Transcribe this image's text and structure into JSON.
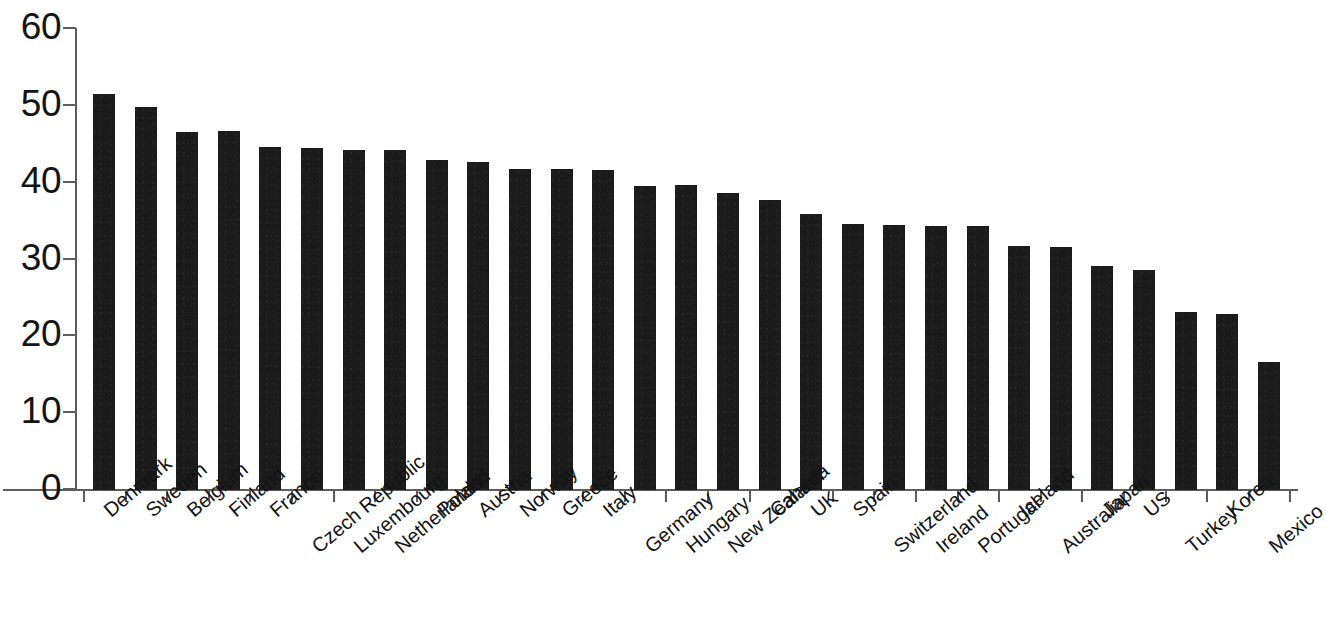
{
  "chart_data": {
    "type": "bar",
    "title": "",
    "subtitle": "",
    "xlabel": "",
    "ylabel": "",
    "ylim": [
      0,
      60
    ],
    "yticks": [
      0,
      10,
      20,
      30,
      40,
      50,
      60
    ],
    "grid": false,
    "legend": null,
    "bar_color": "#1b1b1b",
    "axis_color": "#5d5d5d",
    "categories": [
      "Denmark",
      "Sweden",
      "Belgium",
      "Finland",
      "France",
      "Czech Republic",
      "Luxembourg",
      "Netherlands",
      "Poland",
      "Austria",
      "Norway",
      "Greece",
      "Italy",
      "Germany",
      "Hungary",
      "New Zealand",
      "Canada",
      "UK",
      "Spain",
      "Switzerland",
      "Ireland",
      "Portugal",
      "Iceland",
      "Australia",
      "Japan",
      "US",
      "Turkey",
      "Korea",
      "Mexico"
    ],
    "values": [
      51.5,
      49.8,
      46.6,
      46.7,
      44.7,
      44.5,
      44.2,
      44.2,
      43.0,
      42.7,
      41.8,
      41.8,
      41.7,
      39.6,
      39.7,
      38.7,
      37.8,
      35.9,
      34.6,
      34.5,
      34.4,
      34.4,
      31.8,
      31.6,
      29.2,
      28.6,
      23.2,
      22.9,
      16.6
    ],
    "stagger_rows": [
      0,
      0,
      0,
      0,
      0,
      1,
      1,
      1,
      0,
      0,
      0,
      0,
      0,
      1,
      1,
      1,
      0,
      0,
      0,
      1,
      1,
      1,
      0,
      1,
      0,
      0,
      1,
      0,
      1
    ]
  }
}
